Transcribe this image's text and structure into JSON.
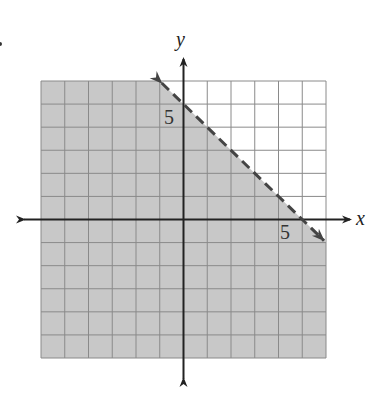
{
  "chart_data": {
    "type": "inequality-graph",
    "title": "",
    "xlabel": "x",
    "ylabel": "y",
    "xlim": [
      -6,
      6
    ],
    "ylim": [
      -6,
      6
    ],
    "grid": true,
    "grid_step": 1,
    "tick_labels": [
      {
        "axis": "x",
        "value": 5,
        "label": "5"
      },
      {
        "axis": "y",
        "value": 5,
        "label": "5"
      }
    ],
    "boundary": {
      "equation": "x + y = 5",
      "slope": -1,
      "y_intercept": 5,
      "style": "dashed",
      "arrows": "both",
      "points": [
        [
          -1,
          6
        ],
        [
          6,
          -1
        ]
      ]
    },
    "shaded_region": {
      "inequality": "x + y < 5",
      "side": "below-left"
    },
    "colors": {
      "shade": "#c8c8c8",
      "grid_line": "#8a8a8a",
      "axis": "#222222",
      "boundary": "#444444",
      "background": "#ffffff"
    }
  },
  "labels": {
    "x_axis": "x",
    "y_axis": "y",
    "x_tick_5": "5",
    "y_tick_5": "5"
  }
}
